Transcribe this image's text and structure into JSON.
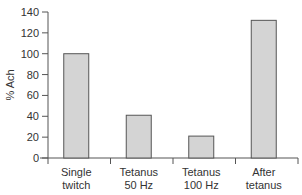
{
  "chart_data": {
    "type": "bar",
    "title": "",
    "xlabel": "",
    "ylabel": "% Ach",
    "ylim": [
      0,
      140
    ],
    "yticks": [
      0,
      20,
      40,
      60,
      80,
      100,
      120,
      140
    ],
    "categories": [
      "Single twitch",
      "Tetanus 50 Hz",
      "Tetanus 100 Hz",
      "After tetanus"
    ],
    "category_lines": [
      [
        "Single",
        "twitch"
      ],
      [
        "Tetanus",
        "50 Hz"
      ],
      [
        "Tetanus",
        "100 Hz"
      ],
      [
        "After",
        "tetanus"
      ]
    ],
    "values": [
      100,
      41,
      21,
      132
    ],
    "grid": false,
    "legend": null,
    "colors": {
      "bar_fill": "#d4d4d4",
      "bar_stroke": "#555555",
      "axis": "#555555"
    }
  }
}
